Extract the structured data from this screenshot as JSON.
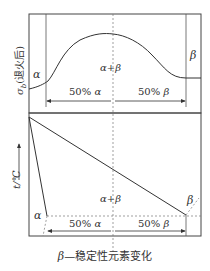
{
  "figure": {
    "top_panel": {
      "y_axis_label": "σ",
      "y_axis_subscript": "b",
      "y_axis_suffix": "(退火后)",
      "phase_labels": {
        "alpha": "α",
        "alpha_beta": "α+β",
        "beta": "β"
      },
      "span_labels": {
        "left": "50%",
        "left_phase": "α",
        "right": "50%",
        "right_phase": "β"
      }
    },
    "bottom_panel": {
      "y_axis_label": "t/℃",
      "y_axis_arrow": "→",
      "phase_labels": {
        "alpha": "α",
        "alpha_beta": "α+β",
        "beta": "β"
      },
      "span_labels": {
        "left": "50%",
        "left_phase": "α",
        "right": "50%",
        "right_phase": "β"
      }
    },
    "caption": {
      "symbol": "β",
      "dash": "—",
      "text": "稳定性元素变化"
    },
    "colors": {
      "line": "#333333",
      "frame": "#444444",
      "dashed": "#777777"
    }
  }
}
